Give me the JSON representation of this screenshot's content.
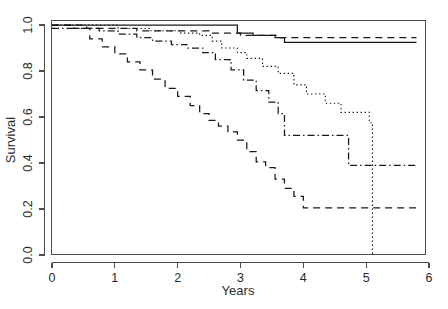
{
  "chart_data": {
    "type": "line",
    "title": "",
    "xlabel": "Years",
    "ylabel": "Survival",
    "xlim": [
      0,
      6
    ],
    "ylim": [
      0,
      1.0
    ],
    "xticks": [
      0,
      1,
      2,
      3,
      4,
      5,
      6
    ],
    "xticklabels": [
      "0",
      "1",
      "2",
      "3",
      "4",
      "5",
      "6"
    ],
    "yticks": [
      0.0,
      0.2,
      0.4,
      0.6,
      0.8,
      1.0
    ],
    "yticklabels": [
      "0.0",
      "0.2",
      "0.4",
      "0.6",
      "0.8",
      "1.0"
    ],
    "grid": false,
    "legend": "none",
    "step_type": "post",
    "series": [
      {
        "name": "group-1-solid",
        "linestyle": "solid",
        "color": "#1a1a1a",
        "x": [
          0.0,
          0.3,
          0.95,
          2.55,
          2.95,
          3.2,
          3.55,
          3.7,
          5.8
        ],
        "y": [
          1.0,
          1.0,
          1.0,
          1.0,
          0.965,
          0.955,
          0.945,
          0.925,
          0.925
        ]
      },
      {
        "name": "group-2-dashed",
        "linestyle": "dashed",
        "color": "#1a1a1a",
        "x": [
          0.0,
          0.55,
          1.1,
          1.35,
          2.1,
          2.5,
          2.8,
          3.0,
          3.6,
          5.8
        ],
        "y": [
          1.0,
          0.985,
          0.985,
          0.975,
          0.975,
          0.965,
          0.965,
          0.955,
          0.945,
          0.945
        ]
      },
      {
        "name": "group-3-dotted",
        "linestyle": "dotted",
        "color": "#555555",
        "x": [
          0.0,
          0.45,
          1.05,
          1.55,
          2.05,
          2.35,
          2.55,
          2.7,
          2.95,
          3.1,
          3.35,
          3.6,
          3.85,
          4.05,
          4.35,
          4.6,
          5.05,
          5.1,
          5.1
        ],
        "y": [
          1.0,
          1.0,
          0.985,
          0.975,
          0.965,
          0.955,
          0.93,
          0.9,
          0.88,
          0.855,
          0.82,
          0.79,
          0.74,
          0.7,
          0.66,
          0.62,
          0.575,
          0.575,
          0.0
        ]
      },
      {
        "name": "group-4-dashdot",
        "linestyle": "dashdot",
        "color": "#1a1a1a",
        "x": [
          0.0,
          0.4,
          0.75,
          1.05,
          1.35,
          1.6,
          1.9,
          2.15,
          2.4,
          2.6,
          2.85,
          3.05,
          3.25,
          3.45,
          3.6,
          3.7,
          4.7,
          4.72,
          5.8
        ],
        "y": [
          0.985,
          0.985,
          0.975,
          0.96,
          0.945,
          0.93,
          0.915,
          0.9,
          0.88,
          0.85,
          0.805,
          0.76,
          0.715,
          0.665,
          0.615,
          0.52,
          0.52,
          0.39,
          0.39
        ]
      },
      {
        "name": "group-5-longdash",
        "linestyle": "longdash",
        "color": "#1a1a1a",
        "x": [
          0.0,
          0.35,
          0.6,
          0.8,
          1.0,
          1.2,
          1.4,
          1.6,
          1.8,
          2.0,
          2.2,
          2.35,
          2.5,
          2.65,
          2.8,
          2.95,
          3.1,
          3.25,
          3.4,
          3.55,
          3.7,
          3.85,
          4.0,
          5.8
        ],
        "y": [
          1.0,
          0.985,
          0.94,
          0.905,
          0.875,
          0.84,
          0.805,
          0.765,
          0.725,
          0.69,
          0.65,
          0.615,
          0.585,
          0.56,
          0.535,
          0.5,
          0.45,
          0.405,
          0.38,
          0.33,
          0.29,
          0.255,
          0.205,
          0.205
        ]
      }
    ]
  },
  "axes": {
    "x_axis_title": "Years",
    "y_axis_title": "Survival"
  }
}
